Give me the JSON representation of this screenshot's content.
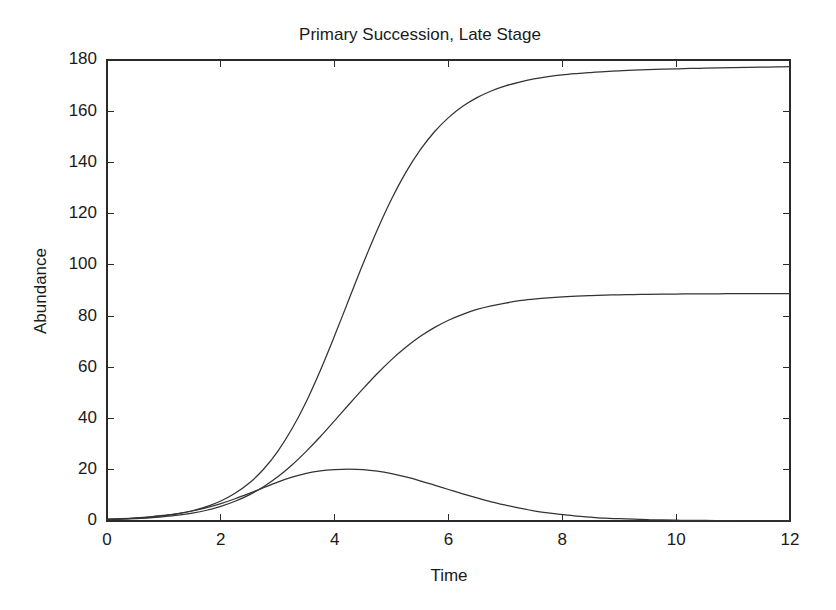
{
  "figure": {
    "background_color": "#ffffff",
    "line_color": "#333333",
    "axis_color": "#2a2a2a",
    "text_color": "#1a1a1a"
  },
  "chart_data": {
    "type": "line",
    "title": "Primary Succession, Late Stage",
    "xlabel": "Time",
    "ylabel": "Abundance",
    "xlim": [
      0,
      12
    ],
    "ylim": [
      0,
      180
    ],
    "xticks": [
      0,
      2,
      4,
      6,
      8,
      10,
      12
    ],
    "yticks": [
      0,
      20,
      40,
      60,
      80,
      100,
      120,
      140,
      160,
      180
    ],
    "xtick_labels": [
      "0",
      "2",
      "4",
      "6",
      "8",
      "10",
      "12"
    ],
    "ytick_labels": [
      "0",
      "20",
      "40",
      "60",
      "80",
      "100",
      "120",
      "140",
      "160",
      "180"
    ],
    "grid": false,
    "legend": "none",
    "box": true,
    "x": [
      0,
      0.25,
      0.5,
      0.75,
      1,
      1.25,
      1.5,
      1.75,
      2,
      2.25,
      2.5,
      2.75,
      3,
      3.25,
      3.5,
      3.75,
      4,
      4.25,
      4.5,
      4.75,
      5,
      5.25,
      5.5,
      5.75,
      6,
      6.25,
      6.5,
      6.75,
      7,
      7.25,
      7.5,
      7.75,
      8,
      8.25,
      8.5,
      8.75,
      9,
      9.25,
      9.5,
      9.75,
      10,
      10.25,
      10.5,
      10.75,
      11,
      11.25,
      11.5,
      11.75,
      12
    ],
    "series": [
      {
        "name": "Species 1",
        "values": [
          0.6,
          0.8,
          1.1,
          1.5,
          2.1,
          2.9,
          4.0,
          5.6,
          7.8,
          10.8,
          14.8,
          20.2,
          27.2,
          36.0,
          46.6,
          58.9,
          72.4,
          86.5,
          100.5,
          113.7,
          125.7,
          136.1,
          144.8,
          151.9,
          157.5,
          161.9,
          165.3,
          167.9,
          169.9,
          171.4,
          172.6,
          173.5,
          174.2,
          174.7,
          175.1,
          175.5,
          175.8,
          176.0,
          176.2,
          176.4,
          176.5,
          176.7,
          176.8,
          176.9,
          177.0,
          177.1,
          177.2,
          177.3,
          177.4
        ],
        "plateau": 177.4
      },
      {
        "name": "Species 2",
        "values": [
          0.5,
          0.7,
          0.9,
          1.2,
          1.7,
          2.3,
          3.1,
          4.2,
          5.7,
          7.7,
          10.2,
          13.4,
          17.3,
          21.9,
          27.2,
          33.0,
          39.2,
          45.5,
          51.7,
          57.6,
          63.0,
          67.8,
          72.0,
          75.5,
          78.4,
          80.7,
          82.6,
          84.0,
          85.1,
          86.0,
          86.6,
          87.1,
          87.5,
          87.8,
          88.0,
          88.2,
          88.3,
          88.4,
          88.5,
          88.6,
          88.6,
          88.7,
          88.7,
          88.7,
          88.8,
          88.8,
          88.8,
          88.8,
          88.8
        ],
        "plateau": 88.8
      },
      {
        "name": "Species 3",
        "values": [
          0.7,
          0.9,
          1.2,
          1.6,
          2.2,
          2.9,
          3.9,
          5.2,
          6.8,
          8.7,
          10.8,
          13.0,
          15.2,
          17.1,
          18.6,
          19.6,
          20.1,
          20.3,
          20.1,
          19.5,
          18.5,
          17.2,
          15.7,
          14.0,
          12.3,
          10.6,
          9.0,
          7.5,
          6.2,
          5.0,
          4.0,
          3.2,
          2.5,
          1.9,
          1.5,
          1.1,
          0.9,
          0.7,
          0.5,
          0.4,
          0.3,
          0.2,
          0.2,
          0.15,
          0.1,
          0.08,
          0.06,
          0.05,
          0.04
        ],
        "peak_value": 20.3,
        "peak_time": 4.25
      }
    ]
  }
}
